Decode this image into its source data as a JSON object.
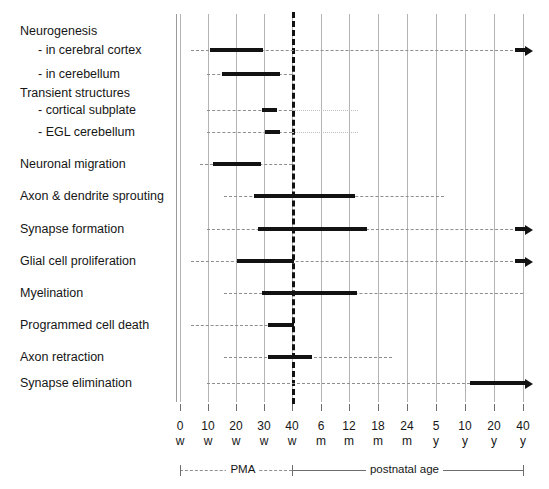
{
  "chart_data": {
    "type": "bar",
    "title": "",
    "xlabel": "",
    "ylabel": "",
    "orientation": "horizontal-timeline",
    "grid": true,
    "legend": "none",
    "axis": {
      "ticks": [
        {
          "num": "0",
          "unit": "w",
          "x": 180
        },
        {
          "num": "10",
          "unit": "w",
          "x": 208
        },
        {
          "num": "20",
          "unit": "w",
          "x": 236
        },
        {
          "num": "30",
          "unit": "w",
          "x": 264
        },
        {
          "num": "40",
          "unit": "w",
          "x": 292
        },
        {
          "num": "6",
          "unit": "m",
          "x": 321
        },
        {
          "num": "12",
          "unit": "m",
          "x": 349
        },
        {
          "num": "18",
          "unit": "m",
          "x": 378
        },
        {
          "num": "24",
          "unit": "m",
          "x": 407
        },
        {
          "num": "5",
          "unit": "y",
          "x": 436
        },
        {
          "num": "10",
          "unit": "y",
          "x": 465
        },
        {
          "num": "20",
          "unit": "y",
          "x": 494
        },
        {
          "num": "40",
          "unit": "y",
          "x": 523
        }
      ],
      "birth_marker_x": 292,
      "periods": [
        {
          "label": "PMA",
          "style": "dashed",
          "x1": 180,
          "x2": 292
        },
        {
          "label": "postnatal age",
          "style": "solid",
          "x1": 292,
          "x2": 523
        }
      ]
    },
    "rows": [
      {
        "label": "Neurogenesis",
        "indent": false,
        "header": true,
        "y": 31,
        "track": null,
        "bar": null
      },
      {
        "label": "-  in cerebral cortex",
        "indent": true,
        "header": false,
        "y": 50,
        "track": {
          "x1": 191,
          "x2": 523
        },
        "bar": {
          "x1": 210,
          "x2": 263
        },
        "arrow": true
      },
      {
        "label": "-  in cerebellum",
        "indent": true,
        "header": false,
        "y": 74,
        "track": {
          "x1": 207,
          "x2": 292
        },
        "bar": {
          "x1": 222,
          "x2": 280
        },
        "arrow": false
      },
      {
        "label": "Transient structures",
        "indent": false,
        "header": true,
        "y": 93,
        "track": null,
        "bar": null
      },
      {
        "label": "-  cortical subplate",
        "indent": true,
        "header": false,
        "y": 110,
        "track": {
          "x1": 207,
          "x2": 292
        },
        "dotted": {
          "x1": 292,
          "x2": 358
        },
        "bar": {
          "x1": 262,
          "x2": 277
        },
        "arrow": false
      },
      {
        "label": "-  EGL cerebellum",
        "indent": true,
        "header": false,
        "y": 132,
        "track": {
          "x1": 207,
          "x2": 292
        },
        "dotted": {
          "x1": 292,
          "x2": 358
        },
        "bar": {
          "x1": 265,
          "x2": 280
        },
        "arrow": false
      },
      {
        "label": "Neuronal migration",
        "indent": false,
        "header": false,
        "y": 164,
        "track": {
          "x1": 200,
          "x2": 292
        },
        "bar": {
          "x1": 213,
          "x2": 261
        },
        "arrow": false
      },
      {
        "label": "Axon & dendrite sprouting",
        "indent": false,
        "header": false,
        "y": 196,
        "track": {
          "x1": 224,
          "x2": 444
        },
        "bar": {
          "x1": 254,
          "x2": 355
        },
        "arrow": false
      },
      {
        "label": "Synapse formation",
        "indent": false,
        "header": false,
        "y": 229,
        "track": {
          "x1": 207,
          "x2": 523
        },
        "bar": {
          "x1": 258,
          "x2": 367
        },
        "arrow": true
      },
      {
        "label": "Glial cell proliferation",
        "indent": false,
        "header": false,
        "y": 261,
        "track": {
          "x1": 191,
          "x2": 523
        },
        "bar": {
          "x1": 237,
          "x2": 294
        },
        "arrow": true
      },
      {
        "label": "Myelination",
        "indent": false,
        "header": false,
        "y": 293,
        "track": {
          "x1": 224,
          "x2": 523
        },
        "bar": {
          "x1": 262,
          "x2": 357
        },
        "arrow": false
      },
      {
        "label": "Programmed cell death",
        "indent": false,
        "header": false,
        "y": 325,
        "track": {
          "x1": 191,
          "x2": 292
        },
        "bar": {
          "x1": 268,
          "x2": 294
        },
        "arrow": false
      },
      {
        "label": "Axon retraction",
        "indent": false,
        "header": false,
        "y": 357,
        "track": {
          "x1": 224,
          "x2": 392
        },
        "bar": {
          "x1": 268,
          "x2": 312
        },
        "arrow": false
      },
      {
        "label": "Synapse elimination",
        "indent": false,
        "header": false,
        "y": 383,
        "track": {
          "x1": 207,
          "x2": 470
        },
        "bar": {
          "x1": 470,
          "x2": 521
        },
        "arrow": true
      }
    ],
    "gridlines_x": [
      180,
      208,
      236,
      264,
      292,
      321,
      349,
      378,
      407,
      436,
      465,
      494,
      523
    ],
    "colors": {
      "bar": "#121212",
      "track": "#8e8e8e",
      "dotted": "#bdbdbd",
      "grid": "#b4b4b4",
      "birth": "#111111",
      "text": "#161616"
    }
  }
}
